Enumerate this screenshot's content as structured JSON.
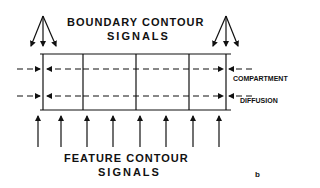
{
  "title": {
    "line1": "BOUNDARY CONTOUR",
    "line2": "SIGNALS"
  },
  "bottom_title": {
    "line1": "FEATURE CONTOUR",
    "line2": "SIGNALS"
  },
  "side_labels": {
    "compartment": "COMPARTMENT",
    "diffusion": "DIFFUSION"
  },
  "panel_label": "b",
  "colors": {
    "ink": "#111111",
    "background": "#ffffff"
  }
}
